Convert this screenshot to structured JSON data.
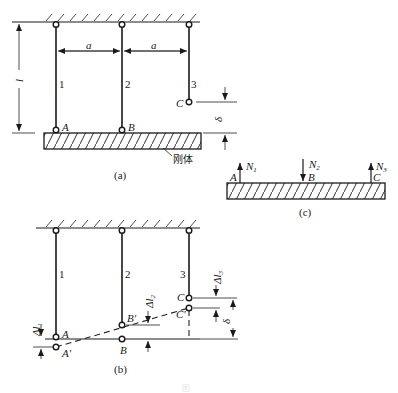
{
  "figure": {
    "panel_a": {
      "caption": "(a)",
      "dim_a1": "a",
      "dim_a2": "a",
      "dim_l": "l",
      "dim_delta": "δ",
      "rod_labels": [
        "1",
        "2",
        "3"
      ],
      "point_A": "A",
      "point_B": "B",
      "point_C": "C",
      "rigid_body_label": "刚体"
    },
    "panel_b": {
      "caption": "(b)",
      "rod_labels": [
        "1",
        "2",
        "3"
      ],
      "point_A": "A",
      "point_A_prime": "A'",
      "point_B": "B",
      "point_B_prime": "B'",
      "point_C": "C",
      "point_C_prime": "C'",
      "dl1": "Δl",
      "dl1_sub": "1",
      "dl2": "Δl",
      "dl2_sub": "2",
      "dl3": "Δl",
      "dl3_sub": "3",
      "dim_delta": "δ"
    },
    "panel_c": {
      "caption": "(c)",
      "force_1": "N",
      "force_1_sub": "1",
      "force_2": "N",
      "force_2_sub": "2",
      "force_3": "N",
      "force_3_sub": "3",
      "point_A": "A",
      "point_B": "B",
      "point_C": "C"
    },
    "bottom_caption": "图"
  }
}
